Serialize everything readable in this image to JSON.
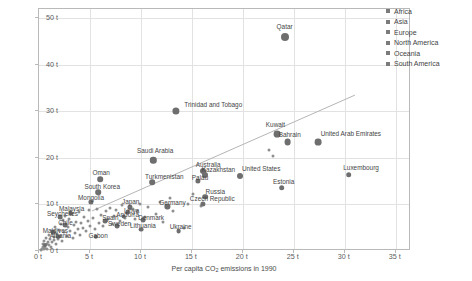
{
  "chart_data": {
    "type": "scatter",
    "title": "",
    "xlabel": "Per capita CO₂ emissions in 1990",
    "ylabel": "Per capita CO₂ emissions in 2016",
    "xlim": [
      0,
      36.5
    ],
    "ylim": [
      0,
      52
    ],
    "xticks": [
      "0 t",
      "5 t",
      "10 t",
      "15 t",
      "20 t",
      "25 t",
      "30 t",
      "35 t"
    ],
    "xtick_values": [
      0,
      5,
      10,
      15,
      20,
      25,
      30,
      35
    ],
    "yticks": [
      "0 t",
      "10 t",
      "20 t",
      "30 t",
      "40 t",
      "50 t"
    ],
    "ytick_values": [
      0,
      10,
      20,
      30,
      40,
      50
    ],
    "grid": true,
    "unit": "t",
    "legend_position": "top-right",
    "legend": [
      {
        "label": "Africa",
        "color": "#7b7b7b"
      },
      {
        "label": "Asia",
        "color": "#7b7b7b"
      },
      {
        "label": "Europe",
        "color": "#7b7b7b"
      },
      {
        "label": "North America",
        "color": "#7b7b7b"
      },
      {
        "label": "Oceania",
        "color": "#7b7b7b"
      },
      {
        "label": "South America",
        "color": "#7b7b7b"
      }
    ],
    "reference_line": {
      "type": "linear",
      "x": [
        5.2,
        31.0
      ],
      "y": [
        8.6,
        33.5
      ]
    },
    "labeled_points": [
      {
        "name": "Qatar",
        "x": 24.1,
        "y": 45.9,
        "r": 4.0,
        "lx": 24.1,
        "ly": 48.3
      },
      {
        "name": "Trinidad and Tobago",
        "x": 13.4,
        "y": 30.1,
        "r": 3.6,
        "lx": 17.1,
        "ly": 31.6
      },
      {
        "name": "Kuwait",
        "x": 23.4,
        "y": 25.2,
        "r": 3.4,
        "lx": 23.2,
        "ly": 27.2
      },
      {
        "name": "Bahrain",
        "x": 24.4,
        "y": 23.4,
        "r": 3.4,
        "lx": 24.6,
        "ly": 25.2
      },
      {
        "name": "United Arab Emirates",
        "x": 27.4,
        "y": 23.4,
        "r": 3.4,
        "lx": 30.6,
        "ly": 25.3
      },
      {
        "name": "Saudi Arabia",
        "x": 11.2,
        "y": 19.5,
        "r": 3.2,
        "lx": 11.4,
        "ly": 21.6
      },
      {
        "name": "Luxembourg",
        "x": 30.4,
        "y": 16.4,
        "r": 2.8,
        "lx": 31.6,
        "ly": 18.0
      },
      {
        "name": "United States",
        "x": 19.7,
        "y": 16.2,
        "r": 3.0,
        "lx": 21.8,
        "ly": 17.8
      },
      {
        "name": "Australia",
        "x": 16.1,
        "y": 17.2,
        "r": 3.0,
        "lx": 16.6,
        "ly": 18.6
      },
      {
        "name": "Kazakhstan",
        "x": 16.3,
        "y": 16.3,
        "r": 3.0,
        "lx": 17.6,
        "ly": 17.6
      },
      {
        "name": "Palau",
        "x": 15.6,
        "y": 15.0,
        "r": 2.6,
        "lx": 15.8,
        "ly": 16.0
      },
      {
        "name": "Estonia",
        "x": 23.8,
        "y": 13.6,
        "r": 2.8,
        "lx": 24.0,
        "ly": 15.1
      },
      {
        "name": "Oman",
        "x": 6.0,
        "y": 15.4,
        "r": 2.8,
        "lx": 6.1,
        "ly": 17.0
      },
      {
        "name": "Turkmenistan",
        "x": 11.1,
        "y": 14.8,
        "r": 2.8,
        "lx": 12.3,
        "ly": 16.1
      },
      {
        "name": "South Korea",
        "x": 5.8,
        "y": 12.6,
        "r": 2.8,
        "lx": 6.2,
        "ly": 13.9
      },
      {
        "name": "Russia",
        "x": 16.3,
        "y": 11.7,
        "r": 2.8,
        "lx": 17.3,
        "ly": 12.9
      },
      {
        "name": "Czech Republic",
        "x": 16.1,
        "y": 10.1,
        "r": 2.6,
        "lx": 17.0,
        "ly": 11.3
      },
      {
        "name": "Mongolia",
        "x": 5.1,
        "y": 10.5,
        "r": 2.6,
        "lx": 5.1,
        "ly": 11.6
      },
      {
        "name": "Japan",
        "x": 8.9,
        "y": 9.5,
        "r": 2.6,
        "lx": 9.0,
        "ly": 10.7
      },
      {
        "name": "Germany",
        "x": 12.6,
        "y": 9.6,
        "r": 2.6,
        "lx": 13.1,
        "ly": 10.6
      },
      {
        "name": "Malaysia",
        "x": 3.1,
        "y": 8.2,
        "r": 2.4,
        "lx": 3.2,
        "ly": 9.3
      },
      {
        "name": "Seychelles",
        "x": 2.1,
        "y": 7.2,
        "r": 2.4,
        "lx": 2.3,
        "ly": 8.1
      },
      {
        "name": "Spain",
        "x": 6.5,
        "y": 6.4,
        "r": 2.4,
        "lx": 7.0,
        "ly": 7.4
      },
      {
        "name": "Libya",
        "x": 8.7,
        "y": 8.4,
        "r": 2.4,
        "lx": 9.1,
        "ly": 8.8
      },
      {
        "name": "Andorra",
        "x": 8.3,
        "y": 7.4,
        "r": 2.4,
        "lx": 8.7,
        "ly": 7.9
      },
      {
        "name": "Denmark",
        "x": 10.2,
        "y": 6.6,
        "r": 2.4,
        "lx": 11.0,
        "ly": 7.4
      },
      {
        "name": "Sweden",
        "x": 7.7,
        "y": 5.3,
        "r": 2.4,
        "lx": 7.9,
        "ly": 6.1
      },
      {
        "name": "Lithuania",
        "x": 10.0,
        "y": 4.6,
        "r": 2.4,
        "lx": 10.2,
        "ly": 5.5
      },
      {
        "name": "Ukraine",
        "x": 13.7,
        "y": 4.3,
        "r": 2.4,
        "lx": 13.9,
        "ly": 5.4
      },
      {
        "name": "Chile",
        "x": 2.6,
        "y": 5.6,
        "r": 2.4,
        "lx": 2.6,
        "ly": 6.3
      },
      {
        "name": "Maldives",
        "x": 1.4,
        "y": 4.0,
        "r": 2.2,
        "lx": 1.6,
        "ly": 4.5
      },
      {
        "name": "Albania",
        "x": 1.9,
        "y": 3.1,
        "r": 2.2,
        "lx": 2.1,
        "ly": 3.5
      },
      {
        "name": "Gabon",
        "x": 5.6,
        "y": 3.0,
        "r": 2.2,
        "lx": 5.8,
        "ly": 3.4
      },
      {
        "name": "Qatar2",
        "x": 0.6,
        "y": 1.3,
        "r": 2.0,
        "lx": 0.9,
        "ly": 1.6
      }
    ],
    "unlabeled_points": [
      {
        "x": 0.2,
        "y": 0.3
      },
      {
        "x": 0.3,
        "y": 0.5
      },
      {
        "x": 0.35,
        "y": 0.9
      },
      {
        "x": 0.4,
        "y": 1.6
      },
      {
        "x": 0.45,
        "y": 0.4
      },
      {
        "x": 0.5,
        "y": 2.2
      },
      {
        "x": 0.55,
        "y": 1.1
      },
      {
        "x": 0.6,
        "y": 0.7
      },
      {
        "x": 0.7,
        "y": 2.9
      },
      {
        "x": 0.75,
        "y": 1.4
      },
      {
        "x": 0.8,
        "y": 0.5
      },
      {
        "x": 0.9,
        "y": 2.0
      },
      {
        "x": 0.95,
        "y": 3.4
      },
      {
        "x": 1.0,
        "y": 1.2
      },
      {
        "x": 1.1,
        "y": 2.5
      },
      {
        "x": 1.2,
        "y": 0.8
      },
      {
        "x": 1.25,
        "y": 4.3
      },
      {
        "x": 1.3,
        "y": 1.9
      },
      {
        "x": 1.45,
        "y": 3.0
      },
      {
        "x": 1.5,
        "y": 2.3
      },
      {
        "x": 1.6,
        "y": 5.1
      },
      {
        "x": 1.7,
        "y": 1.5
      },
      {
        "x": 1.8,
        "y": 3.7
      },
      {
        "x": 1.9,
        "y": 2.6
      },
      {
        "x": 2.0,
        "y": 4.6
      },
      {
        "x": 2.1,
        "y": 3.2
      },
      {
        "x": 2.2,
        "y": 5.8
      },
      {
        "x": 2.3,
        "y": 2.1
      },
      {
        "x": 2.4,
        "y": 6.6
      },
      {
        "x": 2.5,
        "y": 4.0
      },
      {
        "x": 2.6,
        "y": 7.6
      },
      {
        "x": 2.7,
        "y": 3.3
      },
      {
        "x": 2.8,
        "y": 5.2
      },
      {
        "x": 2.9,
        "y": 6.9
      },
      {
        "x": 3.0,
        "y": 4.4
      },
      {
        "x": 3.2,
        "y": 7.9
      },
      {
        "x": 3.3,
        "y": 2.8
      },
      {
        "x": 3.4,
        "y": 5.6
      },
      {
        "x": 3.5,
        "y": 3.9
      },
      {
        "x": 3.6,
        "y": 6.2
      },
      {
        "x": 3.8,
        "y": 4.8
      },
      {
        "x": 3.9,
        "y": 8.3
      },
      {
        "x": 4.0,
        "y": 3.5
      },
      {
        "x": 4.1,
        "y": 6.0
      },
      {
        "x": 4.3,
        "y": 5.0
      },
      {
        "x": 4.4,
        "y": 7.2
      },
      {
        "x": 4.6,
        "y": 4.2
      },
      {
        "x": 4.8,
        "y": 6.4
      },
      {
        "x": 4.9,
        "y": 8.8
      },
      {
        "x": 5.0,
        "y": 5.4
      },
      {
        "x": 5.3,
        "y": 7.0
      },
      {
        "x": 5.5,
        "y": 4.7
      },
      {
        "x": 5.7,
        "y": 9.0
      },
      {
        "x": 5.9,
        "y": 6.1
      },
      {
        "x": 6.1,
        "y": 7.7
      },
      {
        "x": 6.3,
        "y": 5.3
      },
      {
        "x": 6.6,
        "y": 8.6
      },
      {
        "x": 6.8,
        "y": 6.8
      },
      {
        "x": 7.0,
        "y": 9.3
      },
      {
        "x": 7.2,
        "y": 5.9
      },
      {
        "x": 7.4,
        "y": 7.5
      },
      {
        "x": 7.6,
        "y": 8.9
      },
      {
        "x": 7.9,
        "y": 6.5
      },
      {
        "x": 8.1,
        "y": 9.8
      },
      {
        "x": 8.4,
        "y": 7.1
      },
      {
        "x": 8.6,
        "y": 8.1
      },
      {
        "x": 9.2,
        "y": 9.1
      },
      {
        "x": 9.4,
        "y": 6.9
      },
      {
        "x": 9.6,
        "y": 8.5
      },
      {
        "x": 9.9,
        "y": 10.2
      },
      {
        "x": 10.4,
        "y": 7.4
      },
      {
        "x": 10.7,
        "y": 9.4
      },
      {
        "x": 11.5,
        "y": 8.0
      },
      {
        "x": 11.9,
        "y": 10.6
      },
      {
        "x": 12.2,
        "y": 6.3
      },
      {
        "x": 12.9,
        "y": 11.3
      },
      {
        "x": 13.1,
        "y": 8.7
      },
      {
        "x": 14.2,
        "y": 4.9
      },
      {
        "x": 14.6,
        "y": 10.0
      },
      {
        "x": 15.1,
        "y": 12.3
      },
      {
        "x": 15.9,
        "y": 9.7
      },
      {
        "x": 22.6,
        "y": 21.8
      },
      {
        "x": 23.0,
        "y": 20.4
      }
    ]
  }
}
